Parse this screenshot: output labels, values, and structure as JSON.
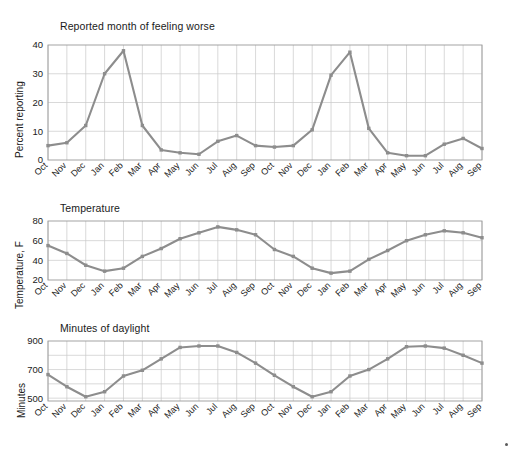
{
  "figure": {
    "background_color": "#ffffff",
    "line_color": "#8d8d8d",
    "grid_color": "#c9c9c9",
    "axis_color": "#9a9a9a",
    "text_color": "#1a1a1a"
  },
  "chart_data": [
    {
      "type": "line",
      "title": "Reported month of feeling worse",
      "xlabel": "",
      "ylabel": "Percent reporting",
      "ylim": [
        0,
        40
      ],
      "yticks": [
        0,
        10,
        20,
        30,
        40
      ],
      "ytick_labels": [
        "0",
        "10",
        "20",
        "30",
        "40"
      ],
      "grid": true,
      "legend": "none",
      "categories": [
        "Oct",
        "Nov",
        "Dec",
        "Jan",
        "Feb",
        "Mar",
        "Apr",
        "May",
        "Jun",
        "Jul",
        "Aug",
        "Sep",
        "Oct",
        "Nov",
        "Dec",
        "Jan",
        "Feb",
        "Mar",
        "Apr",
        "May",
        "Jun",
        "Jul",
        "Aug",
        "Sep"
      ],
      "values": [
        5,
        6,
        12,
        30,
        38,
        12,
        3.5,
        2.5,
        2,
        6.5,
        8.5,
        5,
        4.5,
        5,
        10.5,
        29.5,
        37.5,
        11,
        2.5,
        1.5,
        1.5,
        5.5,
        7.5,
        4
      ]
    },
    {
      "type": "line",
      "title": "Temperature",
      "xlabel": "",
      "ylabel": "Temperature, F",
      "ylim": [
        20,
        80
      ],
      "yticks": [
        20,
        40,
        60,
        80
      ],
      "ytick_labels": [
        "20",
        "40",
        "60",
        "80"
      ],
      "grid": true,
      "legend": "none",
      "categories": [
        "Oct",
        "Nov",
        "Dec",
        "Jan",
        "Feb",
        "Mar",
        "Apr",
        "May",
        "Jun",
        "Jul",
        "Aug",
        "Sep",
        "Oct",
        "Nov",
        "Dec",
        "Jan",
        "Feb",
        "Mar",
        "Apr",
        "May",
        "Jun",
        "Jul",
        "Aug",
        "Sep"
      ],
      "values": [
        55,
        47,
        35,
        29,
        32,
        44,
        52,
        62,
        68,
        74,
        71,
        66,
        51,
        44,
        32,
        27,
        29,
        41,
        50,
        60,
        66,
        70,
        68,
        63
      ]
    },
    {
      "type": "line",
      "title": "Minutes of daylight",
      "xlabel": "",
      "ylabel": "Minutes",
      "ylim": [
        480,
        900
      ],
      "yticks": [
        500,
        700,
        900
      ],
      "ytick_labels": [
        "500",
        "700",
        "900"
      ],
      "minor_yticks": [
        600,
        800
      ],
      "grid": true,
      "legend": "none",
      "categories": [
        "Oct",
        "Nov",
        "Dec",
        "Jan",
        "Feb",
        "Mar",
        "Apr",
        "May",
        "Jun",
        "Jul",
        "Aug",
        "Sep",
        "Oct",
        "Nov",
        "Dec",
        "Jan",
        "Feb",
        "Mar",
        "Apr",
        "May",
        "Jun",
        "Jul",
        "Aug",
        "Sep"
      ],
      "values": [
        665,
        580,
        510,
        545,
        655,
        695,
        775,
        855,
        865,
        865,
        820,
        745,
        660,
        580,
        510,
        545,
        655,
        700,
        775,
        860,
        865,
        850,
        800,
        745
      ]
    }
  ]
}
